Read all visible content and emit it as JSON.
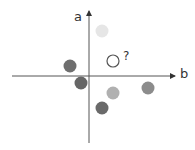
{
  "diagram": {
    "axes": {
      "vertical_label": "a",
      "horizontal_label": "b",
      "color": "#555555"
    },
    "query": {
      "label": "?",
      "x": 113,
      "y": 61,
      "stroke": "#555555"
    },
    "points": [
      {
        "x": 102,
        "y": 31,
        "color": "#e6e6e6"
      },
      {
        "x": 70,
        "y": 66,
        "color": "#6e6e6e"
      },
      {
        "x": 81,
        "y": 83,
        "color": "#666666"
      },
      {
        "x": 113,
        "y": 93,
        "color": "#b0b0b0"
      },
      {
        "x": 148,
        "y": 88,
        "color": "#8c8c8c"
      },
      {
        "x": 102,
        "y": 108,
        "color": "#6a6a6a"
      }
    ]
  }
}
